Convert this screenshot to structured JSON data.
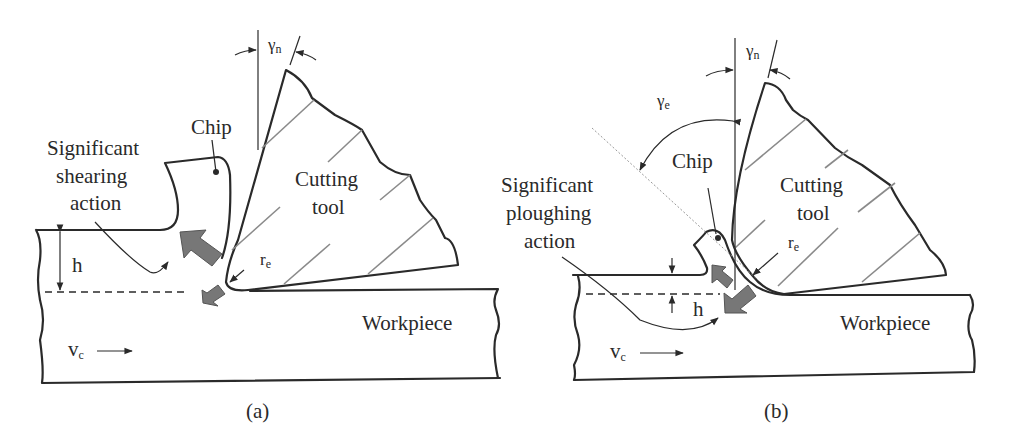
{
  "figure": {
    "panels": [
      {
        "id": "a",
        "caption": "(a)",
        "labels": {
          "rake_angle_symbol": "γ",
          "rake_angle_sub": "n",
          "chip": "Chip",
          "action_line1": "Significant",
          "action_line2": "shearing",
          "action_line3": "action",
          "tool_line1": "Cutting",
          "tool_line2": "tool",
          "edge_radius_symbol": "r",
          "edge_radius_sub": "e",
          "depth": "h",
          "velocity_symbol": "v",
          "velocity_sub": "c",
          "workpiece": "Workpiece"
        }
      },
      {
        "id": "b",
        "caption": "(b)",
        "labels": {
          "rake_angle_symbol": "γ",
          "rake_angle_sub": "n",
          "effective_rake_symbol": "γ",
          "effective_rake_sub": "e",
          "chip": "Chip",
          "action_line1": "Significant",
          "action_line2": "ploughing",
          "action_line3": "action",
          "tool_line1": "Cutting",
          "tool_line2": "tool",
          "edge_radius_symbol": "r",
          "edge_radius_sub": "e",
          "depth": "h",
          "velocity_symbol": "v",
          "velocity_sub": "c",
          "workpiece": "Workpiece"
        }
      }
    ],
    "colors": {
      "line": "#2a2a2a",
      "hatch": "#8a8a8a",
      "force_arrow": "#777777"
    }
  }
}
